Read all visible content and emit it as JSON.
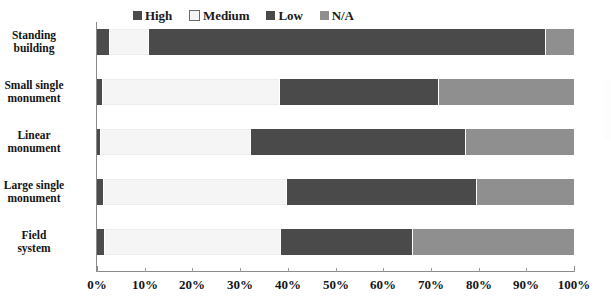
{
  "chart_data": {
    "type": "bar",
    "orientation": "horizontal",
    "stacked": true,
    "normalized_percent": true,
    "title": "",
    "subtitle": "",
    "xlabel": "",
    "ylabel": "",
    "xlim": [
      0,
      100
    ],
    "xticks": [
      "0%",
      "10%",
      "20%",
      "30%",
      "40%",
      "50%",
      "60%",
      "70%",
      "80%",
      "90%",
      "100%"
    ],
    "xtick_values": [
      0,
      10,
      20,
      30,
      40,
      50,
      60,
      70,
      80,
      90,
      100
    ],
    "grid": false,
    "legend_position": "top-center",
    "categories": [
      "Standing building",
      "Small single monument",
      "Linear monument",
      "Large single monument",
      "Field system"
    ],
    "series": [
      {
        "name": "High",
        "color": "#4c4c4c",
        "values": [
          2.5,
          1.0,
          0.6,
          1.2,
          1.5
        ]
      },
      {
        "name": "Medium",
        "color": "#f5f5f5",
        "values": [
          8.2,
          37.2,
          31.5,
          38.4,
          36.9
        ]
      },
      {
        "name": "Low",
        "color": "#4a4a4a",
        "values": [
          83.3,
          33.3,
          45.0,
          39.8,
          27.6
        ]
      },
      {
        "name": "N/A",
        "color": "#8f8f8f",
        "values": [
          6.0,
          28.5,
          22.9,
          20.6,
          34.0
        ]
      }
    ]
  },
  "legend": {
    "entries": [
      {
        "label": "High",
        "swatch": "legend-swatch-high"
      },
      {
        "label": "Medium",
        "swatch": "legend-swatch-medium"
      },
      {
        "label": "Low",
        "swatch": "legend-swatch-low"
      },
      {
        "label": "N/A",
        "swatch": "legend-swatch-na"
      }
    ]
  },
  "y_axis": {
    "category_labels": [
      {
        "line1": "Standing",
        "line2": "building"
      },
      {
        "line1": "Small single",
        "line2": "monument"
      },
      {
        "line1": "Linear",
        "line2": "monument"
      },
      {
        "line1": "Large single",
        "line2": "monument"
      },
      {
        "line1": "Field",
        "line2": "system"
      }
    ]
  },
  "x_axis": {
    "labels": [
      "0%",
      "10%",
      "20%",
      "30%",
      "40%",
      "50%",
      "60%",
      "70%",
      "80%",
      "90%",
      "100%"
    ]
  },
  "colors": {
    "high": "#4c4c4c",
    "medium": "#f5f5f5",
    "low": "#4a4a4a",
    "na": "#8f8f8f",
    "axis": "#8a8a8a",
    "text": "#141414",
    "background": "#ffffff",
    "segment_border": "#ffffff"
  }
}
